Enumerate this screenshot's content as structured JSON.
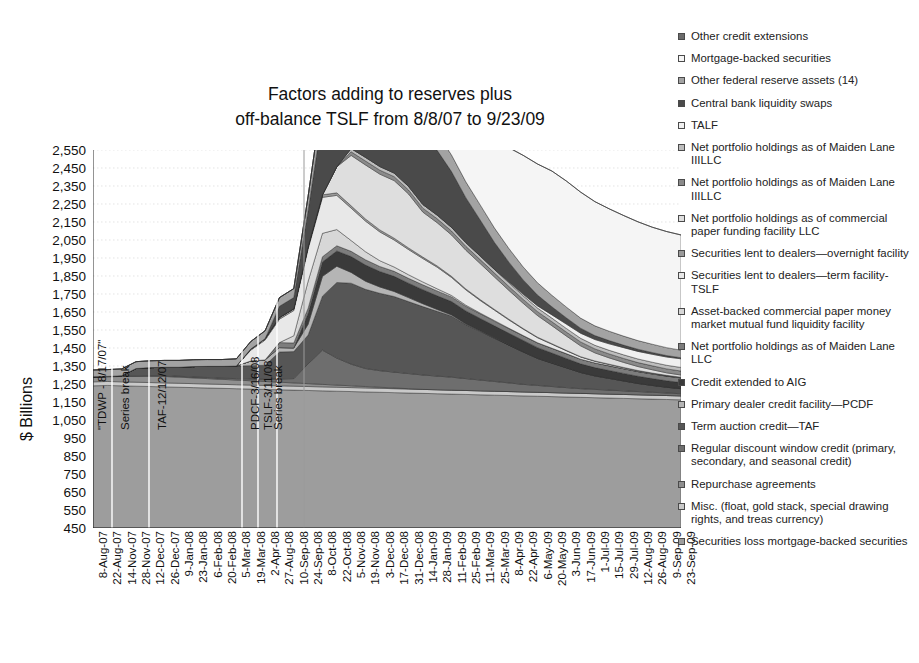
{
  "chart_data": {
    "type": "area",
    "title": "Factors adding to reserves plus off-balance TSLF from 8/8/07 to 9/23/09",
    "title_line1": "Factors adding to reserves plus",
    "title_line2": "off-balance TSLF from 8/8/07 to 9/23/09",
    "xlabel": "",
    "ylabel": "$ Billions",
    "ylim": [
      450,
      2550
    ],
    "ytick_step": 100,
    "grid": true,
    "legend_position": "right",
    "stacked": true,
    "yticks": [
      "2,550",
      "2,450",
      "2,350",
      "2,250",
      "2,150",
      "2,050",
      "1,950",
      "1,850",
      "1,750",
      "1,650",
      "1,550",
      "1,450",
      "1,350",
      "1,250",
      "1,150",
      "1,050",
      "950",
      "850",
      "750",
      "650",
      "550",
      "450"
    ],
    "categories": [
      "8-Aug-07",
      "22-Aug-07",
      "14-Nov-07",
      "28-Nov-07",
      "12-Dec-07",
      "26-Dec-07",
      "9-Jan-08",
      "23-Jan-08",
      "6-Feb-08",
      "20-Feb-08",
      "5-Mar-08",
      "19-Mar-08",
      "2-Apr-08",
      "27-Aug-08",
      "10-Sep-08",
      "24-Sep-08",
      "8-Oct-08",
      "22-Oct-08",
      "5-Nov-08",
      "19-Nov-08",
      "3-Dec-08",
      "17-Dec-08",
      "31-Dec-08",
      "14-Jan-09",
      "28-Jan-09",
      "11-Feb-09",
      "25-Feb-09",
      "11-Mar-09",
      "25-Mar-09",
      "8-Apr-09",
      "22-Apr-09",
      "6-May-09",
      "20-May-09",
      "3-Jun-09",
      "17-Jun-09",
      "1-Jul-09",
      "15-Jul-09",
      "29-Jul-09",
      "12-Aug-09",
      "26-Aug-09",
      "9-Sep-09",
      "23-Sep-09"
    ],
    "x_index": [
      0,
      1,
      2,
      3,
      4,
      5,
      6,
      7,
      8,
      9,
      10,
      11,
      12,
      13,
      14,
      15,
      16,
      17,
      18,
      19,
      20,
      21,
      22,
      23,
      24,
      25,
      26,
      27,
      28,
      29,
      30,
      31,
      32,
      33,
      34,
      35,
      36,
      37,
      38,
      39,
      40,
      41
    ],
    "series": [
      {
        "name": "Securities loss mortgage-backed securities",
        "color": "#9d9d9d",
        "values": [
          790,
          792,
          790,
          788,
          786,
          784,
          782,
          780,
          778,
          776,
          774,
          772,
          770,
          768,
          766,
          764,
          762,
          760,
          758,
          756,
          754,
          752,
          750,
          748,
          746,
          744,
          742,
          740,
          738,
          736,
          734,
          732,
          730,
          728,
          726,
          724,
          722,
          720,
          718,
          716,
          714,
          712
        ]
      },
      {
        "name": "Misc. (float, gold stack, special drawing rights, and treas currency)",
        "color": "#c9c9c9",
        "values": [
          22,
          22,
          22,
          22,
          22,
          22,
          22,
          22,
          22,
          22,
          22,
          22,
          22,
          22,
          22,
          22,
          22,
          22,
          22,
          22,
          22,
          22,
          22,
          22,
          22,
          22,
          22,
          22,
          22,
          22,
          22,
          22,
          22,
          22,
          22,
          22,
          22,
          22,
          22,
          22,
          22,
          22
        ]
      },
      {
        "name": "Repurchase agreements",
        "color": "#8f8f8f",
        "values": [
          26,
          26,
          30,
          32,
          34,
          36,
          34,
          32,
          30,
          28,
          26,
          24,
          22,
          20,
          18,
          16,
          14,
          12,
          10,
          8,
          6,
          4,
          2,
          0,
          0,
          0,
          0,
          0,
          0,
          0,
          0,
          0,
          0,
          0,
          0,
          0,
          0,
          0,
          0,
          0,
          0,
          0
        ]
      },
      {
        "name": "Regular discount window credit (primary, secondary, and seasonal credit)",
        "color": "#6e6e6e",
        "values": [
          2,
          2,
          4,
          4,
          5,
          5,
          5,
          5,
          6,
          6,
          8,
          10,
          12,
          18,
          24,
          110,
          190,
          150,
          120,
          100,
          92,
          88,
          84,
          80,
          76,
          72,
          66,
          60,
          54,
          48,
          42,
          38,
          34,
          30,
          26,
          24,
          22,
          20,
          18,
          16,
          14,
          12
        ]
      },
      {
        "name": "Term auction credit—TAF",
        "color": "#565656",
        "values": [
          0,
          0,
          0,
          40,
          44,
          46,
          50,
          58,
          62,
          66,
          70,
          74,
          78,
          150,
          150,
          160,
          300,
          420,
          450,
          440,
          430,
          420,
          400,
          380,
          360,
          340,
          300,
          270,
          240,
          210,
          180,
          150,
          130,
          110,
          90,
          75,
          65,
          55,
          45,
          38,
          32,
          28
        ]
      },
      {
        "name": "Primary dealer credit facility—PCDF",
        "color": "#b5b5b5",
        "values": [
          0,
          0,
          0,
          0,
          0,
          0,
          0,
          0,
          0,
          0,
          0,
          26,
          30,
          24,
          20,
          60,
          110,
          90,
          60,
          45,
          35,
          28,
          22,
          16,
          10,
          6,
          4,
          2,
          1,
          0,
          0,
          0,
          0,
          0,
          0,
          0,
          0,
          0,
          0,
          0,
          0,
          0
        ]
      },
      {
        "name": "Credit extended to AIG",
        "color": "#3a3a3a",
        "values": [
          0,
          0,
          0,
          0,
          0,
          0,
          0,
          0,
          0,
          0,
          0,
          0,
          0,
          0,
          0,
          60,
          80,
          85,
          88,
          90,
          86,
          84,
          80,
          78,
          76,
          74,
          72,
          70,
          68,
          66,
          64,
          60,
          56,
          52,
          48,
          46,
          44,
          42,
          40,
          38,
          36,
          34
        ]
      },
      {
        "name": "Net portfolio holdings as of Maiden Lane LLC",
        "color": "#7d7d7d",
        "values": [
          0,
          0,
          0,
          0,
          0,
          0,
          0,
          0,
          0,
          0,
          0,
          0,
          0,
          28,
          28,
          29,
          29,
          29,
          29,
          29,
          28,
          28,
          27,
          27,
          27,
          26,
          26,
          26,
          26,
          26,
          26,
          26,
          26,
          26,
          26,
          26,
          26,
          26,
          26,
          26,
          26,
          26
        ]
      },
      {
        "name": "Asset-backed commercial paper money market mutual fund liquidity facility",
        "color": "#d7d7d7",
        "values": [
          0,
          0,
          0,
          0,
          0,
          0,
          0,
          0,
          0,
          0,
          0,
          0,
          0,
          0,
          40,
          150,
          130,
          90,
          60,
          45,
          32,
          24,
          20,
          16,
          12,
          8,
          6,
          4,
          3,
          2,
          1,
          1,
          1,
          1,
          0,
          0,
          0,
          0,
          0,
          0,
          0,
          0
        ]
      },
      {
        "name": "Securities lent to dealers—term facility-TSLF",
        "color": "#e8e8e8",
        "values": [
          0,
          0,
          0,
          0,
          0,
          0,
          0,
          0,
          0,
          0,
          0,
          60,
          110,
          130,
          140,
          180,
          200,
          190,
          180,
          170,
          160,
          150,
          140,
          130,
          120,
          100,
          85,
          70,
          58,
          46,
          36,
          28,
          22,
          16,
          12,
          9,
          7,
          5,
          4,
          3,
          2,
          2
        ]
      },
      {
        "name": "Securities lent to dealers—overnight facility",
        "color": "#9a9a9a",
        "values": [
          0,
          0,
          0,
          0,
          0,
          0,
          0,
          0,
          0,
          0,
          0,
          6,
          8,
          10,
          10,
          12,
          14,
          14,
          13,
          12,
          11,
          10,
          9,
          8,
          7,
          6,
          5,
          5,
          4,
          4,
          3,
          3,
          3,
          2,
          2,
          2,
          2,
          2,
          2,
          2,
          2,
          2
        ]
      },
      {
        "name": "Net portfolio holdings as of commercial paper funding facility LLC",
        "color": "#dedede",
        "values": [
          0,
          0,
          0,
          0,
          0,
          0,
          0,
          0,
          0,
          0,
          0,
          0,
          0,
          0,
          0,
          0,
          0,
          145,
          280,
          300,
          310,
          320,
          300,
          250,
          240,
          230,
          215,
          200,
          180,
          160,
          140,
          120,
          100,
          80,
          60,
          45,
          35,
          28,
          22,
          18,
          14,
          12
        ]
      },
      {
        "name": "Net portfolio holdings as of Maiden Lane IIILLC",
        "color": "#8a8a8a",
        "values": [
          0,
          0,
          0,
          0,
          0,
          0,
          0,
          0,
          0,
          0,
          0,
          0,
          0,
          0,
          0,
          0,
          0,
          0,
          20,
          22,
          22,
          22,
          22,
          22,
          22,
          22,
          22,
          22,
          22,
          22,
          22,
          22,
          22,
          22,
          22,
          22,
          22,
          22,
          22,
          22,
          22,
          22
        ]
      },
      {
        "name": "Net portfolio holdings as of Maiden Lane IIILLC (II)",
        "color": "#bdbdbd",
        "values": [
          0,
          0,
          0,
          0,
          0,
          0,
          0,
          0,
          0,
          0,
          0,
          0,
          0,
          0,
          0,
          0,
          0,
          0,
          18,
          20,
          20,
          20,
          20,
          20,
          20,
          20,
          20,
          20,
          20,
          20,
          20,
          20,
          20,
          20,
          20,
          20,
          20,
          20,
          20,
          20,
          20,
          20
        ]
      },
      {
        "name": "TALF",
        "color": "#f0f0f0",
        "values": [
          0,
          0,
          0,
          0,
          0,
          0,
          0,
          0,
          0,
          0,
          0,
          0,
          0,
          0,
          0,
          0,
          0,
          0,
          0,
          0,
          0,
          0,
          0,
          0,
          0,
          0,
          0,
          0,
          0,
          5,
          8,
          12,
          18,
          24,
          28,
          32,
          36,
          40,
          42,
          44,
          46,
          48
        ]
      },
      {
        "name": "Central bank liquidity swaps",
        "color": "#4a4a4a",
        "values": [
          0,
          0,
          0,
          0,
          0,
          0,
          0,
          0,
          0,
          0,
          0,
          0,
          0,
          62,
          62,
          200,
          440,
          540,
          590,
          580,
          550,
          500,
          460,
          410,
          360,
          310,
          250,
          200,
          150,
          110,
          80,
          60,
          45,
          35,
          28,
          22,
          18,
          14,
          12,
          10,
          8,
          6
        ]
      },
      {
        "name": "Other federal reserve assets (14)",
        "color": "#a3a3a3",
        "values": [
          38,
          38,
          38,
          38,
          38,
          38,
          38,
          38,
          38,
          38,
          40,
          42,
          44,
          48,
          50,
          80,
          110,
          120,
          118,
          115,
          112,
          108,
          104,
          100,
          96,
          92,
          88,
          84,
          80,
          76,
          72,
          68,
          64,
          60,
          56,
          54,
          52,
          50,
          48,
          46,
          44,
          42
        ]
      },
      {
        "name": "Mortgage-backed securities",
        "color": "#f5f5f5",
        "values": [
          0,
          0,
          0,
          0,
          0,
          0,
          0,
          0,
          0,
          0,
          0,
          0,
          0,
          0,
          0,
          0,
          0,
          0,
          0,
          0,
          0,
          10,
          60,
          160,
          240,
          300,
          380,
          440,
          500,
          560,
          620,
          660,
          690,
          700,
          700,
          690,
          680,
          670,
          660,
          650,
          645,
          640
        ]
      },
      {
        "name": "Other credit extensions",
        "color": "#6b6b6b",
        "values": [
          0,
          0,
          0,
          0,
          0,
          0,
          0,
          0,
          0,
          0,
          0,
          0,
          0,
          0,
          0,
          0,
          0,
          0,
          0,
          0,
          0,
          0,
          0,
          0,
          0,
          0,
          0,
          0,
          0,
          0,
          0,
          0,
          0,
          0,
          0,
          0,
          0,
          0,
          0,
          0,
          0,
          0
        ]
      }
    ],
    "annotations": [
      {
        "text": "\"TDWP - 8/17/07\"",
        "x_px": 96,
        "y_px": 430
      },
      {
        "text": "Series break",
        "x_px": 119,
        "y_px": 430
      },
      {
        "text": "TAF-12/12/07",
        "x_px": 156,
        "y_px": 430
      },
      {
        "text": "PDCF-3/16/08",
        "x_px": 249,
        "y_px": 430
      },
      {
        "text": "TSLF-3/11/08",
        "x_px": 262,
        "y_px": 430
      },
      {
        "text": "Series break",
        "x_px": 272,
        "y_px": 430
      }
    ],
    "series_break_lines": [
      {
        "x_px": 112,
        "full_height": false
      },
      {
        "x_px": 149,
        "full_height": false
      },
      {
        "x_px": 242,
        "full_height": false
      },
      {
        "x_px": 258,
        "full_height": false
      },
      {
        "x_px": 277,
        "full_height": false
      },
      {
        "x_px": 304,
        "full_height": true
      }
    ]
  },
  "legend": {
    "items": [
      {
        "label": "Other credit extensions",
        "color": "#6b6b6b"
      },
      {
        "label": "Mortgage-backed securities",
        "color": "#f5f5f5"
      },
      {
        "label": "Other federal reserve assets (14)",
        "color": "#a3a3a3"
      },
      {
        "label": "Central bank liquidity swaps",
        "color": "#4a4a4a"
      },
      {
        "label": "TALF",
        "color": "#f0f0f0"
      },
      {
        "label": "Net portfolio holdings as of Maiden Lane IIILLC",
        "color": "#bdbdbd"
      },
      {
        "label": "Net portfolio holdings as of Maiden Lane IIILLC",
        "color": "#8a8a8a"
      },
      {
        "label": "Net portfolio holdings as of commercial paper funding facility LLC",
        "color": "#dedede"
      },
      {
        "label": "Securities lent to dealers—overnight facility",
        "color": "#9a9a9a"
      },
      {
        "label": "Securities lent to dealers—term facility-TSLF",
        "color": "#e8e8e8"
      },
      {
        "label": "Asset-backed commercial paper money market mutual fund liquidity facility",
        "color": "#d7d7d7"
      },
      {
        "label": "Net portfolio holdings as of Maiden Lane LLC",
        "color": "#7d7d7d"
      },
      {
        "label": "Credit extended to AIG",
        "color": "#3a3a3a"
      },
      {
        "label": "Primary dealer credit facility—PCDF",
        "color": "#b5b5b5"
      },
      {
        "label": "Term auction credit—TAF",
        "color": "#565656"
      },
      {
        "label": "Regular discount window credit (primary, secondary, and seasonal credit)",
        "color": "#6e6e6e"
      },
      {
        "label": "Repurchase agreements",
        "color": "#8f8f8f"
      },
      {
        "label": "Misc. (float, gold stack, special drawing rights, and treas currency)",
        "color": "#c9c9c9"
      },
      {
        "label": "Securities loss mortgage-backed securities",
        "color": "#9d9d9d"
      }
    ]
  }
}
